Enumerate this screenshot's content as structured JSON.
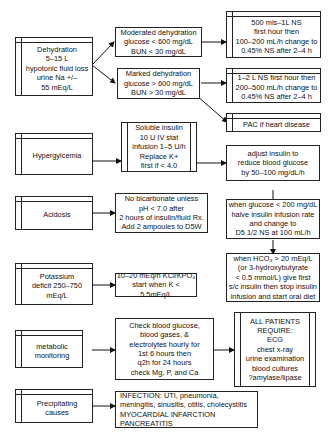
{
  "left": {
    "dehydration": "Dehydration\n5–15 L\nhypotonic fluid loss\nurine Na +/–\n55 mEq/L",
    "hyperglycemia": "Hypergylcemia",
    "acidosis": "Acidosis",
    "potassium": "Potassium\ndeficit 250–750\nmEq/L",
    "metabolic": "metabolic\nmonitoring",
    "precipitating": "Precipitating\ncauses"
  },
  "middle": {
    "moderate": "Moderated dehydration\nglucose < 600 mg/dL\nBUN < 30 mg/dL",
    "marked": "Marked dehydration\nglucose > 600 mg/dL\nBUN > 30 mg/dL",
    "insulin": "Soluble insulin\n10 U IV stat\ninfusion 1–5 U/h\nReplace K+\nfirst if < 4.0",
    "bicarb": "No bicarbonate unless\npH < 7.0 after\n2 hours of insulin/fluid Rx.\nAdd 2 ampoules to D5W",
    "kcl": "10–20 mEq/h KCl/KPO₄\nstart when K < 5.5mEq/L",
    "check": "Check blood glucose,\nblood gases, &\nelectrolytes hourly for\n1st 6 hours then\nq2h for 24 hours\ncheck Mg, P, and Ca",
    "infection": "INFECTION: UTI, pneumonia,\nmeningitis, sinusitis, otitis, cholecystitis\nMYOCARDIAL INFARCTION\nPANCREATITIS"
  },
  "right": {
    "ns_moderate": "500 mls–1L NS\nfirst hour then\n100–200 mL/h change to\n0.45% NS after 2–4 h",
    "ns_marked": "1–2 L NS first hour then\n200–500 mL/h change to\n0.45% NS after 2–4 h",
    "pac": "PAC if heart disease",
    "adjust": "adjust insulin to\nreduce blood glucose\nby 50–100 mg/dL/h",
    "halve": "when glucose < 200 mg/dL\nhalve insulin infusion rate\nand change to\nD5 1/2 NS at 100 mL/h",
    "hco3": "when HCO₃ > 20 mEq/L\n(or 3-hydroxybutyrate\n< 0.5 mmol/L) give first\ns/c insulin then stop insulin\ninfusion and start oral diet",
    "all_patients": "ALL PATIENTS\nREQUIRE:\nECG\nchest x-ray\nurine examination\nblood cultures\n?amylase/lipase"
  }
}
